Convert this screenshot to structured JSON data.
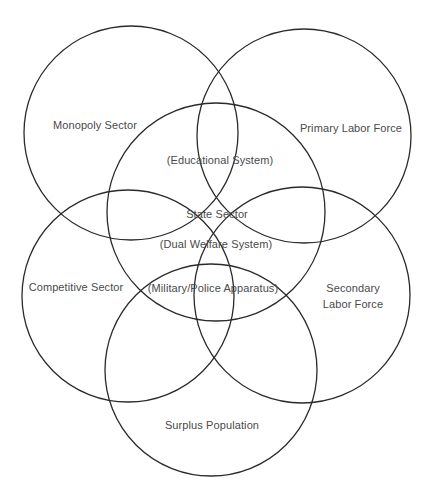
{
  "diagram": {
    "type": "venn",
    "circles": [
      {
        "id": "monopoly",
        "label": "Monopoly Sector"
      },
      {
        "id": "primary",
        "label": "Primary Labor Force"
      },
      {
        "id": "state",
        "label": "State Sector"
      },
      {
        "id": "competitive",
        "label": "Competitive Sector"
      },
      {
        "id": "secondary",
        "label": "Secondary Labor Force",
        "label_lines": [
          "Secondary",
          "Labor Force"
        ]
      },
      {
        "id": "surplus",
        "label": "Surplus Population"
      }
    ],
    "subsystems": {
      "educational": "(Educational System)",
      "welfare": "(Dual Welfare System)",
      "military": "(Military/Police Apparatus)"
    }
  }
}
